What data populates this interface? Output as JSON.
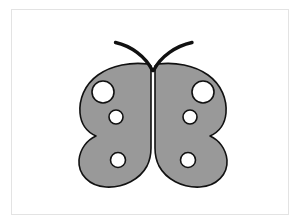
{
  "canvas": {
    "width": 304,
    "height": 224,
    "background_color": "#ffffff",
    "title": "Butterfly Clipart"
  },
  "frame": {
    "border_color": "#e3e3e3",
    "border_width": 1,
    "x": 11,
    "y": 9,
    "width": 278,
    "height": 206,
    "fill_color": "#ffffff"
  },
  "artwork": {
    "name": "butterfly",
    "center_x": 153,
    "outline_color": "#111111",
    "outline_width": 1.6,
    "wing_fill_color": "#999999",
    "spot_fill_color": "#ffffff",
    "antenna_color": "#111111",
    "antenna_width": 3.4,
    "bounds": {
      "left": 79,
      "top": 42,
      "right": 227,
      "bottom": 187
    },
    "wings": [
      {
        "side": "left",
        "label": "left-wing",
        "upper_lobe": {
          "cx": 113,
          "cy": 107,
          "rx": 34,
          "ry": 45
        },
        "lower_lobe": {
          "cx": 122,
          "cy": 156,
          "rx": 28,
          "ry": 31
        }
      },
      {
        "side": "right",
        "label": "right-wing",
        "upper_lobe": {
          "cx": 193,
          "cy": 107,
          "rx": 34,
          "ry": 45
        },
        "lower_lobe": {
          "cx": 184,
          "cy": 156,
          "rx": 28,
          "ry": 31
        }
      }
    ],
    "spots": [
      {
        "id": "left-upper-large-spot",
        "cx": 103,
        "cy": 92,
        "r": 11.0
      },
      {
        "id": "left-upper-small-spot",
        "cx": 116,
        "cy": 117,
        "r": 7.0
      },
      {
        "id": "left-lower-spot",
        "cx": 118,
        "cy": 160,
        "r": 7.5
      },
      {
        "id": "right-upper-large-spot",
        "cx": 203,
        "cy": 92,
        "r": 11.0
      },
      {
        "id": "right-upper-small-spot",
        "cx": 190,
        "cy": 117,
        "r": 7.0
      },
      {
        "id": "right-lower-spot",
        "cx": 188,
        "cy": 160,
        "r": 7.5
      }
    ],
    "antennae": [
      {
        "id": "left-antenna",
        "tip_x": 115,
        "tip_y": 42,
        "base_x": 153,
        "base_y": 71,
        "path": "M 115.5 42.5 C 131 46 145 56 152.5 70.5"
      },
      {
        "id": "right-antenna",
        "tip_x": 192,
        "tip_y": 42,
        "base_x": 153,
        "base_y": 71,
        "path": "M 192.0 42.5 C 176 46 161 56 153.5 70.5"
      }
    ]
  },
  "accessibility": {
    "alt_text": "Grey butterfly with spotted wings and curved antennae"
  }
}
